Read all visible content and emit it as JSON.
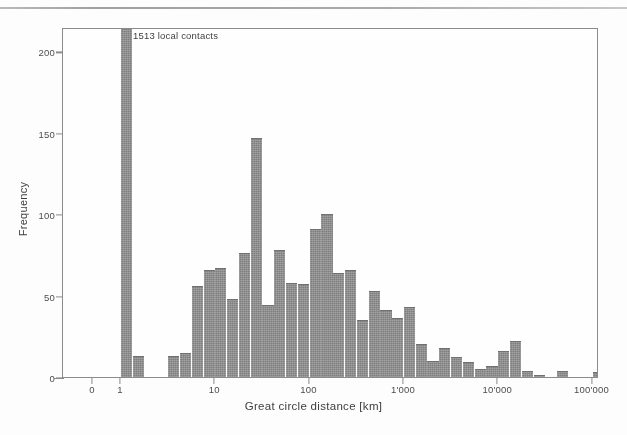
{
  "figure": {
    "annotation": "1513 local contacts"
  },
  "chart_data": {
    "type": "bar",
    "title": "",
    "subtitle": "",
    "xlabel": "Great circle distance [km]",
    "ylabel": "Frequency",
    "grid": false,
    "legend": null,
    "annotations": [
      {
        "text": "1513 local contacts",
        "x_km": 1.3,
        "y": 205,
        "note": "labels the truncated leftmost bar at 1 km which exceeds the plotted y-range"
      }
    ],
    "x_scale": "log",
    "x_tick_labels": [
      "0",
      "1",
      "10",
      "100",
      "1'000",
      "10'000",
      "100'000"
    ],
    "x_tick_values": [
      0,
      1,
      10,
      100,
      1000,
      10000,
      100000
    ],
    "xlim_km": [
      1,
      200000
    ],
    "y_scale": "linear",
    "y_tick_labels": [
      "0",
      "50",
      "100",
      "150",
      "200"
    ],
    "y_tick_values": [
      0,
      50,
      100,
      150,
      200
    ],
    "ylim": [
      0,
      215
    ],
    "bin_edges_km": [
      1.0,
      1.33,
      1.78,
      2.37,
      3.16,
      4.22,
      5.62,
      7.5,
      10.0,
      13.3,
      17.8,
      23.7,
      31.6,
      42.2,
      56.2,
      75.0,
      100,
      133,
      178,
      237,
      316,
      422,
      562,
      750,
      1000,
      1334,
      1778,
      2371,
      3162,
      4217,
      5623,
      7499,
      10000,
      13335,
      17783,
      23714,
      31623,
      42170,
      56234,
      74989,
      100000,
      133352,
      177828
    ],
    "bar_centers_km": [
      1.15,
      1.54,
      2.05,
      2.74,
      3.65,
      4.87,
      6.49,
      8.66,
      11.5,
      15.4,
      20.5,
      27.4,
      36.5,
      48.7,
      64.9,
      86.6,
      115,
      154,
      205,
      274,
      365,
      487,
      649,
      866,
      1155,
      1540,
      2054,
      2738,
      3652,
      4870,
      6494,
      8660,
      11548,
      15399,
      20535,
      27384,
      36517,
      48697,
      64938,
      86596,
      115478,
      153993
    ],
    "categories": [
      "1.2",
      "1.5",
      "2.1",
      "2.7",
      "3.7",
      "4.9",
      "6.5",
      "8.7",
      "11.5",
      "15.4",
      "20.5",
      "27.4",
      "36.5",
      "48.7",
      "64.9",
      "86.6",
      "115",
      "154",
      "205",
      "274",
      "365",
      "487",
      "649",
      "866",
      "1155",
      "1540",
      "2054",
      "2738",
      "3652",
      "4870",
      "6494",
      "8660",
      "11548",
      "15399",
      "20535",
      "27384",
      "36517",
      "48697",
      "64938",
      "86596",
      "115478",
      "153993"
    ],
    "values": [
      1513,
      13,
      0,
      0,
      13,
      15,
      56,
      66,
      67,
      48,
      76,
      147,
      44,
      78,
      58,
      57,
      91,
      100,
      64,
      66,
      35,
      53,
      41,
      36,
      43,
      20,
      10,
      18,
      12,
      9,
      5,
      7,
      16,
      22,
      4,
      1,
      0,
      4,
      0,
      0,
      3,
      0
    ],
    "clipped_bars": [
      {
        "index": 0,
        "actual_value": 1513,
        "plotted_max": 215,
        "note": "bar runs off the top of the axis; annotated as 1513 local contacts"
      }
    ],
    "series": [
      {
        "name": "Frequency",
        "color": "#7d7d7d",
        "values": [
          1513,
          13,
          0,
          0,
          13,
          15,
          56,
          66,
          67,
          48,
          76,
          147,
          44,
          78,
          58,
          57,
          91,
          100,
          64,
          66,
          35,
          53,
          41,
          36,
          43,
          20,
          10,
          18,
          12,
          9,
          5,
          7,
          16,
          22,
          4,
          1,
          0,
          4,
          0,
          0,
          3,
          0
        ]
      }
    ]
  },
  "colors": {
    "bar_fill": "#7d7d7d",
    "axis": "#8a8a8a",
    "text": "#3c3c3c",
    "background": "#ffffff"
  }
}
